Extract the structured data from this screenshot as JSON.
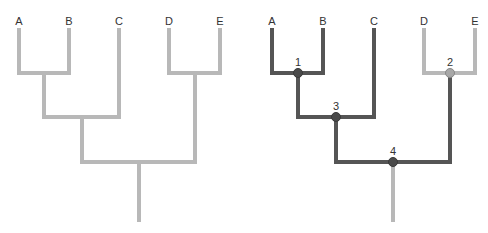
{
  "colors": {
    "light": "#b8b8b8",
    "dark": "#555555",
    "node_dark": "#4a4a4a",
    "node_light": "#a8a8a8",
    "text": "#333333"
  },
  "left_tree": {
    "taxa": [
      {
        "label": "A",
        "x": 19
      },
      {
        "label": "B",
        "x": 69
      },
      {
        "label": "C",
        "x": 119
      },
      {
        "label": "D",
        "x": 169
      },
      {
        "label": "E",
        "x": 220
      }
    ]
  },
  "right_tree": {
    "taxa": [
      {
        "label": "A",
        "x": 272
      },
      {
        "label": "B",
        "x": 323
      },
      {
        "label": "C",
        "x": 374
      },
      {
        "label": "D",
        "x": 424
      },
      {
        "label": "E",
        "x": 475
      }
    ],
    "nodes": [
      {
        "label": "1",
        "x": 298,
        "y": 73,
        "style": "dark"
      },
      {
        "label": "2",
        "x": 450,
        "y": 73,
        "style": "light"
      },
      {
        "label": "3",
        "x": 336,
        "y": 117,
        "style": "dark"
      },
      {
        "label": "4",
        "x": 393,
        "y": 162,
        "style": "dark"
      }
    ]
  }
}
